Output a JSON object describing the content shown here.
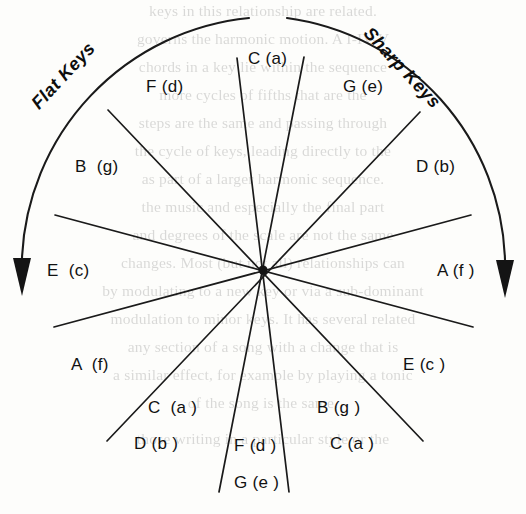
{
  "diagram": {
    "center": {
      "x": 263,
      "y": 270
    },
    "radius": 252,
    "stroke_color": "#1a1a1a",
    "background_color": "#fdfdfb",
    "arc": {
      "label_left": "Flat Keys",
      "label_right": "Sharp Keys",
      "left_arrow": "arrow-down",
      "right_arrow": "arrow-down"
    },
    "spokes": 12,
    "labels": [
      {
        "id": "c-a-top",
        "text": "C (a)",
        "x": 248,
        "y": 49,
        "align": "left"
      },
      {
        "id": "f-d-upper",
        "text": "F (d)",
        "x": 146,
        "y": 77,
        "align": "left"
      },
      {
        "id": "g-e-upper",
        "text": "G (e)",
        "x": 343,
        "y": 77,
        "align": "left"
      },
      {
        "id": "b-g-upper",
        "text": "B  (g)",
        "x": 75,
        "y": 157,
        "align": "left"
      },
      {
        "id": "d-b-upper",
        "text": "D (b)",
        "x": 416,
        "y": 157,
        "align": "left"
      },
      {
        "id": "e-c-left",
        "text": "E  (c)",
        "x": 47,
        "y": 261,
        "align": "left"
      },
      {
        "id": "a-f-right",
        "text": "A (f )",
        "x": 437,
        "y": 261,
        "align": "left"
      },
      {
        "id": "a-f-lower",
        "text": "A  (f)",
        "x": 71,
        "y": 355,
        "align": "left"
      },
      {
        "id": "e-c-lower",
        "text": "E (c )",
        "x": 403,
        "y": 355,
        "align": "left"
      },
      {
        "id": "c-a-lower-left",
        "text": "C  (a )",
        "x": 148,
        "y": 398,
        "align": "left"
      },
      {
        "id": "b-g-lower",
        "text": "B (g )",
        "x": 317,
        "y": 398,
        "align": "left"
      },
      {
        "id": "d-b-lower",
        "text": "D (b )",
        "x": 134,
        "y": 434,
        "align": "left"
      },
      {
        "id": "c-a-lower-right",
        "text": "C (a )",
        "x": 330,
        "y": 434,
        "align": "left"
      },
      {
        "id": "f-d-lower",
        "text": "F (d )",
        "x": 234,
        "y": 436,
        "align": "left"
      },
      {
        "id": "g-e-lower",
        "text": "G (e )",
        "x": 234,
        "y": 473,
        "align": "left"
      }
    ]
  },
  "bleed_through": {
    "lines": [
      {
        "text": "keys in this relationship are related.",
        "y": 2
      },
      {
        "text": "governs the harmonic motion. A I-IV-V",
        "y": 30
      },
      {
        "text": "chords in a key lie within the sequence",
        "y": 58
      },
      {
        "text": "more cycles of fifths that are the",
        "y": 86
      },
      {
        "text": "steps are the same and passing through",
        "y": 114
      },
      {
        "text": "the cycle of keys, leading directly to the",
        "y": 142
      },
      {
        "text": "as part of a larger harmonic sequence.",
        "y": 170
      },
      {
        "text": "the music and especially the final part",
        "y": 198
      },
      {
        "text": "and degrees of the scale are not the same",
        "y": 226
      },
      {
        "text": "changes. Most (but not all) relationships can",
        "y": 254
      },
      {
        "text": "by modulating to a new key or via a sub-dominant",
        "y": 282
      },
      {
        "text": "modulation to minor keys. It has several related",
        "y": 310
      },
      {
        "text": "any section of a song with a change that is",
        "y": 338
      },
      {
        "text": "a similar effect, for example by playing a tonic",
        "y": 366
      },
      {
        "text": "of the song is the same.",
        "y": 394
      },
      {
        "text": "those writing in a particular style or the",
        "y": 430
      }
    ]
  }
}
